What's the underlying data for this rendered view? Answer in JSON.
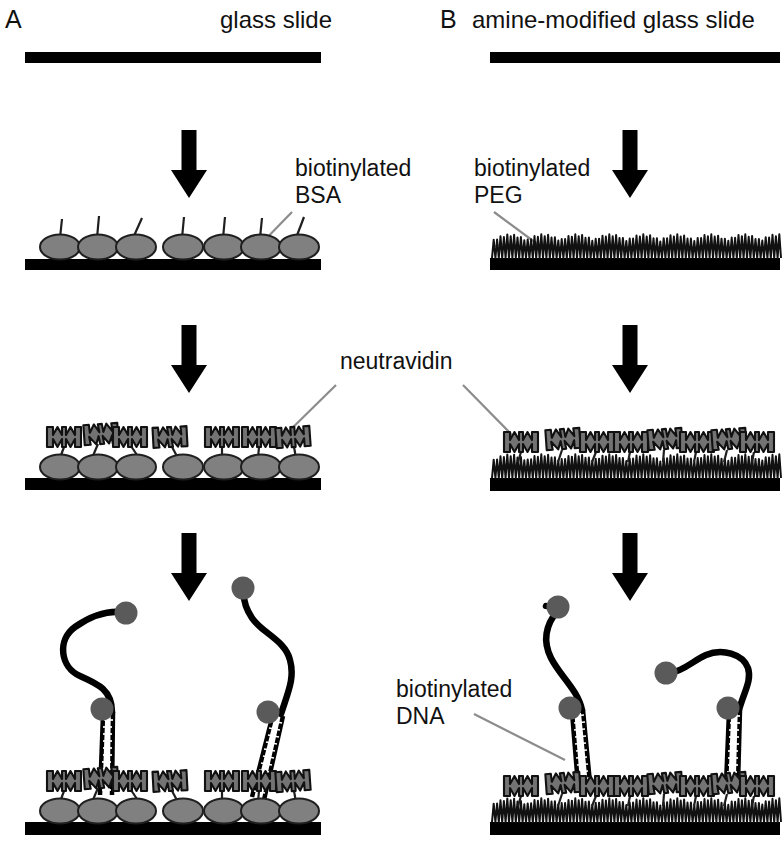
{
  "figure": {
    "title_alt": "Surface passivation schemes for single-molecule DNA immobilization",
    "colors": {
      "slide": "#000000",
      "bsa_fill": "#808080",
      "bsa_stroke": "#1a1a1a",
      "neutravidin_fill": "#737373",
      "neutravidin_stroke": "#111111",
      "peg_stroke": "#111111",
      "dna_strand": "#000000",
      "bead_fill": "#5a5a5a",
      "leader_line": "#8c8c8c",
      "arrow": "#000000",
      "background": "#ffffff"
    },
    "panels": [
      {
        "id": "A",
        "letter": "A",
        "header": "glass slide",
        "surface_type": "glass slide",
        "passivation": "biotinylated BSA",
        "steps": [
          "glass slide",
          "biotinylated BSA",
          "neutravidin",
          "biotinylated DNA"
        ],
        "bsa_count": 7,
        "neutravidin_count": 7,
        "dna_count": 2
      },
      {
        "id": "B",
        "letter": "B",
        "header": "amine-modified glass slide",
        "surface_type": "amine-modified glass slide",
        "passivation": "biotinylated PEG",
        "steps": [
          "amine-modified glass slide",
          "biotinylated PEG",
          "neutravidin",
          "biotinylated DNA"
        ],
        "peg_brush": true,
        "neutravidin_count": 9,
        "dna_count": 2
      }
    ],
    "annotations": {
      "biotinylated_bsa": "biotinylated\nBSA",
      "biotinylated_bsa_line1": "biotinylated",
      "biotinylated_bsa_line2": "BSA",
      "biotinylated_peg_line1": "biotinylated",
      "biotinylated_peg_line2": "PEG",
      "neutravidin": "neutravidin",
      "biotinylated_dna_line1": "biotinylated",
      "biotinylated_dna_line2": "DNA"
    },
    "arrows": {
      "count": 6,
      "direction": "down",
      "labels": [
        "step-1-A",
        "step-1-B",
        "step-2-A",
        "step-2-B",
        "step-3-A",
        "step-3-B"
      ]
    }
  }
}
